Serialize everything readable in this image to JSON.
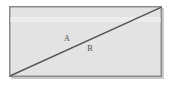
{
  "figure": {
    "background_color": "#ffffff",
    "canvas": {
      "width": 171,
      "height": 87
    },
    "shape": {
      "name": "rectangle",
      "fill_color": "#e3e3e3",
      "border_color": "#8a8a8a",
      "border_width": 1.5,
      "x": 9,
      "y": 6,
      "width": 153,
      "height": 71
    },
    "band": {
      "name": "highlight-band",
      "color": "#ececec",
      "y": 17,
      "height": 5
    },
    "diagonal": {
      "name": "diagonal-line",
      "color": "#555555",
      "width": 1.5,
      "x1": 10,
      "y1": 76,
      "x2": 161,
      "y2": 7
    },
    "shadow": {
      "color": "#c9c9c9"
    },
    "labels": [
      {
        "id": "A",
        "text": "A",
        "region": "upper-left triangle",
        "x": 67,
        "y": 39
      },
      {
        "id": "B",
        "text": "B",
        "region": "lower-right triangle",
        "x": 90,
        "y": 49
      }
    ]
  }
}
